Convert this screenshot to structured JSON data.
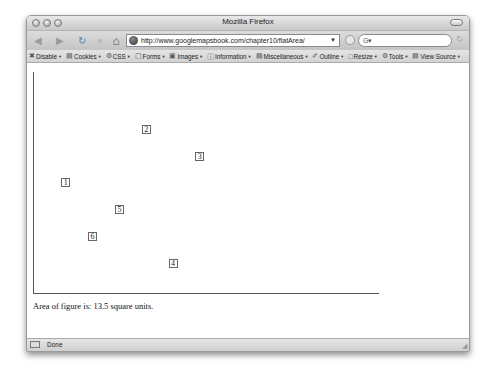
{
  "window": {
    "title": "Mozilla Firefox",
    "url": "http://www.googlemapsbook.com/chapter10/flatArea/",
    "search_placeholder": "G▾",
    "status": "Done"
  },
  "nav": {
    "back_icon": "◀",
    "forward_icon": "▶",
    "reload_icon": "↻",
    "stop_icon": "●",
    "home_icon": "⌂",
    "url_drop_icon": "▼",
    "search_reload_icon": "↻"
  },
  "devbar": {
    "items": [
      {
        "icon": "✖",
        "label": "Disable"
      },
      {
        "icon": "▤",
        "label": "Cookies"
      },
      {
        "icon": "⚙",
        "label": "CSS"
      },
      {
        "icon": "▢",
        "label": "Forms"
      },
      {
        "icon": "▣",
        "label": "Images"
      },
      {
        "icon": "ⓘ",
        "label": "Information"
      },
      {
        "icon": "▤",
        "label": "Miscellaneous"
      },
      {
        "icon": "✐",
        "label": "Outline"
      },
      {
        "icon": "□",
        "label": "Resize"
      },
      {
        "icon": "⚙",
        "label": "Tools"
      },
      {
        "icon": "▤",
        "label": "View Source"
      }
    ]
  },
  "page": {
    "area_text": "Area of figure is: 13.5 square units.",
    "points": [
      {
        "label": "1",
        "x": 1,
        "y": 4
      },
      {
        "label": "2",
        "x": 4,
        "y": 6
      },
      {
        "label": "3",
        "x": 6,
        "y": 5
      },
      {
        "label": "4",
        "x": 5,
        "y": 1
      },
      {
        "label": "5",
        "x": 3,
        "y": 3
      },
      {
        "label": "6",
        "x": 2,
        "y": 2
      }
    ]
  },
  "chart_data": {
    "type": "scatter",
    "title": "",
    "xlabel": "",
    "ylabel": "",
    "points": [
      {
        "label": "1",
        "x": 1,
        "y": 4
      },
      {
        "label": "2",
        "x": 4,
        "y": 6
      },
      {
        "label": "3",
        "x": 6,
        "y": 5
      },
      {
        "label": "4",
        "x": 5,
        "y": 1
      },
      {
        "label": "5",
        "x": 3,
        "y": 3
      },
      {
        "label": "6",
        "x": 2,
        "y": 2
      }
    ],
    "annotation": "Area of figure is: 13.5 square units."
  }
}
